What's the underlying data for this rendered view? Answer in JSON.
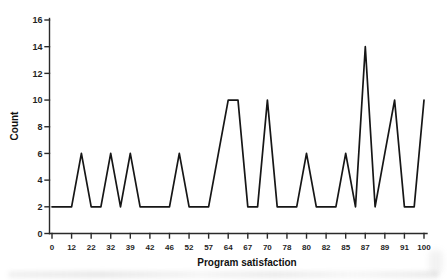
{
  "figure": {
    "background": "#ffffff",
    "line_color": "#161616",
    "axis_color": "#2a2a2a",
    "tick_label_color": "#1f1f1f",
    "title_color": "#111111"
  },
  "chart_data": {
    "type": "line",
    "subtype": "frequency-polygon",
    "title": "",
    "xlabel": "Program satisfaction",
    "ylabel": "Count",
    "ylim": [
      0,
      16
    ],
    "y_ticks": [
      0,
      2,
      4,
      6,
      8,
      10,
      12,
      14,
      16
    ],
    "x_tick_labels": [
      "0",
      "12",
      "22",
      "32",
      "39",
      "42",
      "46",
      "52",
      "57",
      "64",
      "67",
      "70",
      "78",
      "80",
      "82",
      "85",
      "87",
      "89",
      "91",
      "100"
    ],
    "categories": [
      "0",
      "",
      "12",
      "",
      "22",
      "",
      "32",
      "",
      "39",
      "",
      "42",
      "",
      "46",
      "",
      "52",
      "",
      "57",
      "",
      "64",
      "",
      "67",
      "",
      "70",
      "",
      "78",
      "",
      "80",
      "",
      "82",
      "",
      "85",
      "",
      "87",
      "",
      "89",
      "",
      "91",
      "",
      "100"
    ],
    "values": [
      2,
      2,
      2,
      6,
      2,
      2,
      6,
      2,
      6,
      2,
      2,
      2,
      2,
      6,
      2,
      2,
      2,
      6,
      10,
      10,
      2,
      2,
      10,
      2,
      2,
      2,
      6,
      2,
      2,
      2,
      6,
      2,
      14,
      2,
      6,
      10,
      2,
      2,
      10
    ],
    "grid": false,
    "legend": "none"
  }
}
